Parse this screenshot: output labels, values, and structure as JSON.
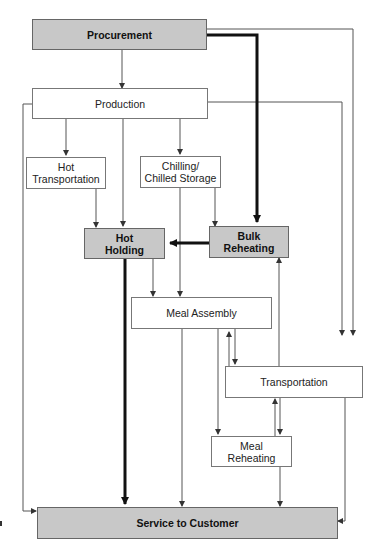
{
  "diagram": {
    "type": "flowchart",
    "colors": {
      "highlight_fill": "#c8c8c8",
      "plain_fill": "#ffffff",
      "line": "#444444",
      "thick_line": "#111111"
    },
    "nodes": [
      {
        "id": "procurement",
        "label": "Procurement",
        "highlighted": true
      },
      {
        "id": "production",
        "label": "Production",
        "highlighted": false
      },
      {
        "id": "hot_transportation",
        "label": "Hot Transportation",
        "line1": "Hot",
        "line2": "Transportation",
        "highlighted": false
      },
      {
        "id": "chilling",
        "label": "Chilling/ Chilled Storage",
        "line1": "Chilling/",
        "line2": "Chilled Storage",
        "highlighted": false
      },
      {
        "id": "hot_holding",
        "label": "Hot Holding",
        "line1": "Hot",
        "line2": "Holding",
        "highlighted": true
      },
      {
        "id": "bulk_reheating",
        "label": "Bulk Reheating",
        "line1": "Bulk",
        "line2": "Reheating",
        "highlighted": true
      },
      {
        "id": "meal_assembly",
        "label": "Meal Assembly",
        "highlighted": false
      },
      {
        "id": "transportation",
        "label": "Transportation",
        "highlighted": false
      },
      {
        "id": "meal_reheating",
        "label": "Meal Reheating",
        "line1": "Meal",
        "line2": "Reheating",
        "highlighted": false
      },
      {
        "id": "service",
        "label": "Service to Customer",
        "highlighted": true
      }
    ],
    "edges": [
      {
        "from": "procurement",
        "to": "production",
        "thick": false
      },
      {
        "from": "procurement",
        "to": "bulk_reheating",
        "thick": true
      },
      {
        "from": "procurement",
        "to": "transportation",
        "thick": false
      },
      {
        "from": "production",
        "to": "hot_transportation",
        "thick": false
      },
      {
        "from": "production",
        "to": "hot_holding",
        "thick": false
      },
      {
        "from": "production",
        "to": "chilling",
        "thick": false
      },
      {
        "from": "production",
        "to": "service",
        "thick": false
      },
      {
        "from": "production",
        "to": "transportation",
        "thick": false
      },
      {
        "from": "hot_transportation",
        "to": "hot_holding",
        "thick": false
      },
      {
        "from": "chilling",
        "to": "bulk_reheating",
        "thick": false
      },
      {
        "from": "chilling",
        "to": "meal_assembly",
        "thick": false
      },
      {
        "from": "bulk_reheating",
        "to": "hot_holding",
        "thick": true
      },
      {
        "from": "hot_holding",
        "to": "meal_assembly",
        "thick": false
      },
      {
        "from": "hot_holding",
        "to": "service",
        "thick": true
      },
      {
        "from": "meal_assembly",
        "to": "service",
        "thick": false
      },
      {
        "from": "meal_assembly",
        "to": "transportation",
        "thick": false
      },
      {
        "from": "transportation",
        "to": "meal_assembly",
        "thick": false
      },
      {
        "from": "meal_assembly",
        "to": "meal_reheating",
        "thick": false
      },
      {
        "from": "transportation",
        "to": "bulk_reheating",
        "thick": false
      },
      {
        "from": "transportation",
        "to": "meal_reheating",
        "thick": false
      },
      {
        "from": "meal_reheating",
        "to": "transportation",
        "thick": false
      },
      {
        "from": "meal_reheating",
        "to": "service",
        "thick": false
      },
      {
        "from": "transportation",
        "to": "service",
        "thick": false
      }
    ]
  }
}
